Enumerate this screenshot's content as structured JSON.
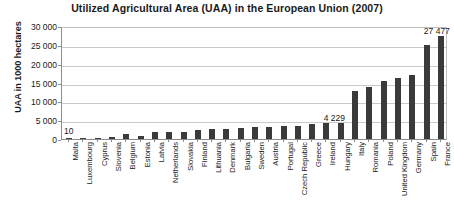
{
  "chart_data": {
    "type": "bar",
    "title": "Utilized Agricultural Area (UAA) in the European Union (2007)",
    "xlabel": "",
    "ylabel": "UAA in 1000 hectares",
    "ylim": [
      0,
      30000
    ],
    "ytick_labels": [
      "30 000",
      "25 000",
      "20 000",
      "15 000",
      "10 000",
      "5 000",
      "0"
    ],
    "ytick_values": [
      30000,
      25000,
      20000,
      15000,
      10000,
      5000,
      0
    ],
    "grid": true,
    "legend": "none",
    "categories": [
      "Malta",
      "Luxembourg",
      "Cyprus",
      "Slovenia",
      "Belgium",
      "Estonia",
      "Latvia",
      "Netherlands",
      "Slovakia",
      "Finland",
      "Lithuania",
      "Denmark",
      "Bulgaria",
      "Sweden",
      "Austria",
      "Portugal",
      "Czech Republic",
      "Greece",
      "Ireland",
      "Hungary",
      "Italy",
      "Romania",
      "Poland",
      "United Kingdom",
      "Germany",
      "Spain",
      "France"
    ],
    "values": [
      10,
      131,
      146,
      489,
      1374,
      907,
      1774,
      1914,
      1937,
      2292,
      2649,
      2663,
      3051,
      3118,
      3189,
      3473,
      3518,
      4076,
      4139,
      4229,
      12744,
      13753,
      15477,
      16130,
      16932,
      24893,
      27477
    ],
    "annotations": [
      {
        "label": "10",
        "category": "Malta",
        "value": 10
      },
      {
        "label": "4 229",
        "category": "Hungary",
        "value": 4229
      },
      {
        "label": "27 477",
        "category": "France",
        "value": 27477
      }
    ],
    "bar_color": "#3a3a3a",
    "grid_color": "#c9c9c9",
    "axis_color": "#8c8c8c",
    "background": "#ffffff"
  }
}
